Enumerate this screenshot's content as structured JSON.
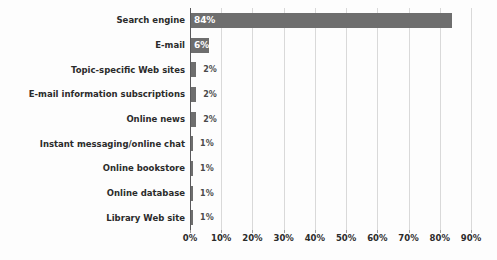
{
  "chart_data": {
    "type": "bar",
    "orientation": "horizontal",
    "title": "",
    "subtitle": "",
    "xlabel": "",
    "ylabel": "",
    "xlim": [
      0,
      90
    ],
    "grid": true,
    "legend": false,
    "categories": [
      "Search engine",
      "E-mail",
      "Topic-specific Web sites",
      "E-mail information subscriptions",
      "Online news",
      "Instant messaging/online chat",
      "Online bookstore",
      "Online database",
      "Library Web site"
    ],
    "values": [
      84,
      6,
      2,
      2,
      2,
      1,
      1,
      1,
      1
    ],
    "data_labels": [
      "84%",
      "6%",
      "2%",
      "2%",
      "2%",
      "1%",
      "1%",
      "1%",
      "1%"
    ],
    "xticks": [
      0,
      10,
      20,
      30,
      40,
      50,
      60,
      70,
      80,
      90
    ],
    "xtick_labels": [
      "0%",
      "10%",
      "20%",
      "30%",
      "40%",
      "50%",
      "60%",
      "70%",
      "80%",
      "90%"
    ],
    "colors": {
      "bar": "#6e6e6e",
      "gridline": "#d9d9d9",
      "axis": "#59595b",
      "label_text": "#2b2b2b",
      "value_inside": "#ffffff",
      "value_outside": "#4a4a4a",
      "background": "#fdfdfd"
    }
  }
}
